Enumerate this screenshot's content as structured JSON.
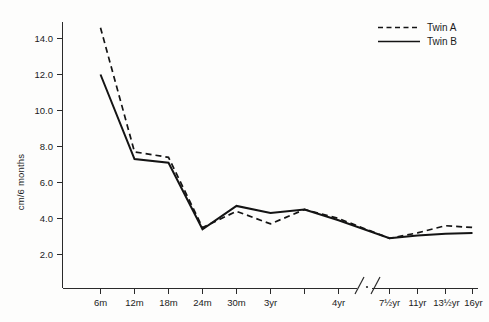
{
  "chart_data": {
    "type": "line",
    "title": "",
    "xlabel": "",
    "ylabel": "cm/6 months",
    "ylim": [
      0,
      15.2
    ],
    "yticks": [
      2.0,
      4.0,
      6.0,
      8.0,
      10.0,
      12.0,
      14.0
    ],
    "ytick_labels": [
      "2.0",
      "4.0",
      "6.0",
      "8.0",
      "10.0",
      "12.0",
      "14.0"
    ],
    "grid": false,
    "legend_position": "top-right",
    "axis_break": {
      "present": true,
      "between": [
        "7½yr",
        "11yr"
      ],
      "style": "double-slash"
    },
    "categories": [
      "6m",
      "12m",
      "18m",
      "24m",
      "30m",
      "3yr",
      "",
      "4yr",
      "7½yr",
      "11yr",
      "13½yr",
      "16yr"
    ],
    "xtick_labels": [
      "6m",
      "12m",
      "18m",
      "24m",
      "30m",
      "3yr",
      "",
      "4yr",
      "7½yr",
      "11yr",
      "13½yr",
      "16yr"
    ],
    "series": [
      {
        "name": "Twin A",
        "style": "dashed",
        "color": "#141414",
        "x": [
          "6m",
          "12m",
          "18m",
          "24m",
          "30m",
          "3yr",
          "",
          "4yr",
          "7½yr",
          "11yr",
          "13½yr",
          "16yr"
        ],
        "values": [
          14.6,
          7.7,
          7.4,
          3.5,
          4.4,
          3.7,
          4.5,
          4.0,
          2.9,
          3.2,
          3.6,
          3.5
        ]
      },
      {
        "name": "Twin B",
        "style": "solid",
        "color": "#141414",
        "x": [
          "6m",
          "12m",
          "18m",
          "24m",
          "30m",
          "3yr",
          "",
          "4yr",
          "7½yr",
          "11yr",
          "13½yr",
          "16yr"
        ],
        "values": [
          12.0,
          7.3,
          7.1,
          3.4,
          4.7,
          4.3,
          4.5,
          3.9,
          2.9,
          3.05,
          3.15,
          3.2
        ]
      }
    ]
  },
  "legend": {
    "entries": [
      {
        "label": "Twin A",
        "style": "dashed"
      },
      {
        "label": "Twin B",
        "style": "solid"
      }
    ]
  },
  "axis": {
    "y_title": "cm/6 months"
  }
}
